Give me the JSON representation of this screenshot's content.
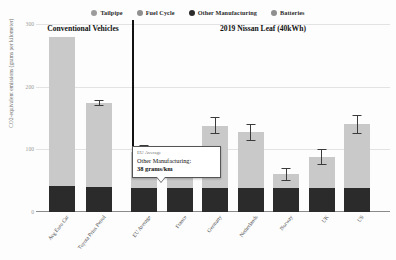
{
  "legend": {
    "items": [
      {
        "label": "Tailpipe",
        "color": "#9c9c9c",
        "icon": "circle-marker"
      },
      {
        "label": "Fuel Cycle",
        "color": "#8f8f8f",
        "icon": "circle-marker"
      },
      {
        "label": "Other Manufacturing",
        "color": "#2b2b2b",
        "icon": "circle-marker"
      },
      {
        "label": "Batteries",
        "color": "#8f8f8f",
        "icon": "circle-marker"
      }
    ]
  },
  "groups": [
    {
      "title": "Conventional Vehicles"
    },
    {
      "title": "2019 Nissan Leaf (40kWh)"
    }
  ],
  "callout": {
    "title": "EU Average",
    "line": "Other Manufacturing:",
    "value": "38 grams/km"
  },
  "chart_data": {
    "type": "bar",
    "stacked": true,
    "title": "",
    "xlabel": "",
    "ylabel": "CO2-equivalent emissions (grams per kilometer)",
    "ylim": [
      0,
      300
    ],
    "yticks": [
      0,
      100,
      200,
      300
    ],
    "grid": true,
    "legend_position": "top-center",
    "categories": [
      "Avg Euro Car",
      "Toyota Prius Petrol",
      "EU Average",
      "France",
      "Germany",
      "Netherlands",
      "Norway",
      "UK",
      "US"
    ],
    "series": [
      {
        "name": "Other Manufacturing",
        "color": "#2b2b2b",
        "values": [
          42,
          40,
          38,
          38,
          38,
          38,
          38,
          38,
          38
        ]
      },
      {
        "name": "Tailpipe",
        "color": "#c9c9c9",
        "values": [
          238,
          134,
          0,
          0,
          0,
          0,
          0,
          0,
          0
        ]
      },
      {
        "name": "Fuel Cycle",
        "color": "#c9c9c9",
        "values": [
          0,
          0,
          0,
          0,
          0,
          0,
          0,
          0,
          0
        ]
      },
      {
        "name": "Batteries",
        "color": "#c9c9c9",
        "values": [
          0,
          0,
          57,
          22,
          100,
          89,
          22,
          50,
          102
        ]
      }
    ],
    "totals": [
      280,
      174,
      95,
      60,
      138,
      127,
      60,
      88,
      140
    ],
    "errors": [
      {
        "low": 0,
        "high": 0
      },
      {
        "low": 5,
        "high": 5
      },
      {
        "low": 12,
        "high": 12
      },
      {
        "low": 0,
        "high": 0
      },
      {
        "low": 13,
        "high": 13
      },
      {
        "low": 13,
        "high": 13
      },
      {
        "low": 11,
        "high": 11
      },
      {
        "low": 13,
        "high": 13
      },
      {
        "low": 15,
        "high": 15
      }
    ],
    "annotation": {
      "category": "EU Average",
      "series": "Other Manufacturing",
      "value": 38,
      "unit": "grams/km"
    }
  }
}
